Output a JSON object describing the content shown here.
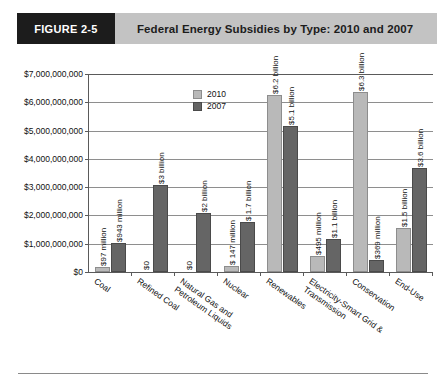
{
  "header": {
    "badge": "FIGURE 2-5",
    "title": "Federal Energy Subsidies by Type: 2010 and 2007"
  },
  "legend": [
    {
      "label": "2010",
      "color": "#b9b9b9"
    },
    {
      "label": "2007",
      "color": "#656565"
    }
  ],
  "chart_data": {
    "type": "bar",
    "title": "Federal Energy Subsidies by Type: 2010 and 2007",
    "xlabel": "",
    "ylabel": "",
    "ylim": [
      0,
      7000000000
    ],
    "grid": true,
    "legend_position": "top-left",
    "ytick_labels": [
      "$7,000,000,000",
      "$6,000,000,000",
      "$5,000,000,000",
      "$4,000,000,000",
      "$3,000,000,000",
      "$2,000,000,000",
      "$1,000,000,000",
      "$0"
    ],
    "ytick_values": [
      7000000000,
      6000000000,
      5000000000,
      4000000000,
      3000000000,
      2000000000,
      1000000000,
      0
    ],
    "categories": [
      "Coal",
      "Refined Coal",
      "Natural Gas and Petroleum Liquids",
      "Nuclear",
      "Renewables",
      "Electricity-Smart Grid & Transmission",
      "Conservation",
      "End-Use"
    ],
    "category_lines": [
      [
        "Coal"
      ],
      [
        "Refined Coal"
      ],
      [
        "Natural Gas and",
        "Petroleum Liquids"
      ],
      [
        "Nuclear"
      ],
      [
        "Renewables"
      ],
      [
        "Electricity-Smart Grid &",
        "Transmission"
      ],
      [
        "Conservation"
      ],
      [
        "End-Use"
      ]
    ],
    "series": [
      {
        "name": "2010",
        "color": "#b9b9b9",
        "values": [
          97000000,
          0,
          0,
          147000000,
          6200000000,
          495000000,
          6300000000,
          1500000000
        ],
        "data_labels": [
          "$97 million",
          "$0",
          "$0",
          "$ 147 million",
          "$6.2 billion",
          "$495 million",
          "$6.3 billion",
          "$1.5 billion"
        ]
      },
      {
        "name": "2007",
        "color": "#656565",
        "values": [
          943000000,
          3000000000,
          2000000000,
          1700000000,
          5100000000,
          1100000000,
          369000000,
          3600000000
        ],
        "data_labels": [
          "$943 million",
          "$3 billion",
          "$2 billion",
          "$ 1.7 billion",
          "$5.1 billion",
          "$1.1 billion",
          "$369 million",
          "$3.6 billion"
        ]
      }
    ]
  }
}
